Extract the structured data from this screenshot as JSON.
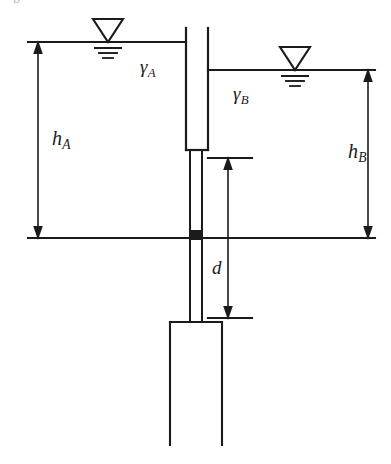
{
  "figure": {
    "type": "engineering-diagram",
    "background_color": "#ffffff",
    "line_color": "#1b1b1b",
    "width": 391,
    "height": 464
  },
  "labels": {
    "gamma_a": {
      "symbol": "γ",
      "subscript": "A"
    },
    "gamma_b": {
      "symbol": "γ",
      "subscript": "B"
    },
    "h_a": {
      "symbol": "h",
      "subscript": "A"
    },
    "h_b": {
      "symbol": "h",
      "subscript": "B"
    },
    "d": {
      "symbol": "d",
      "subscript": ""
    },
    "cut_off_top": "B"
  },
  "elements": {
    "water_surface_left": {
      "name": "water-surface-line-left",
      "y": 42,
      "x1": 28,
      "x2": 186
    },
    "water_surface_right": {
      "name": "water-surface-line-right",
      "y": 70,
      "x1": 208,
      "x2": 375
    },
    "ground_line": {
      "name": "ground-surface-line",
      "y": 238,
      "x1": 28,
      "x2": 375
    },
    "water_table_symbol_left": {
      "name": "water-table-symbol-left",
      "x": 108,
      "y": 42
    },
    "water_table_symbol_right": {
      "name": "water-table-symbol-right",
      "x": 295,
      "y": 70
    },
    "wall_upper_box": {
      "name": "wall-upper-section",
      "x1": 186,
      "x2": 208,
      "y1": 28,
      "y2": 150
    },
    "wall_shaft": {
      "name": "wall-shaft",
      "x1": 190,
      "x2": 202,
      "y1": 150,
      "y2": 322
    },
    "wall_lower_box": {
      "name": "wall-lower-section",
      "x1": 170,
      "x2": 222,
      "y1": 322,
      "y2": 445
    },
    "hinge_marker": {
      "name": "hinge-marker",
      "x": 195,
      "y": 238,
      "size": 8,
      "fill": "#1b1b1b"
    },
    "dimension_h_a": {
      "name": "dimension-arrow-h-a",
      "x": 38,
      "y1": 42,
      "y2": 238
    },
    "dimension_h_b": {
      "name": "dimension-arrow-h-b",
      "x": 368,
      "y1": 70,
      "y2": 238
    },
    "dimension_d": {
      "name": "dimension-arrow-d",
      "x": 228,
      "y1": 158,
      "y2": 318
    },
    "dimension_d_tick_top": {
      "name": "dimension-tick-top",
      "y": 158,
      "x1": 208,
      "x2": 252
    },
    "dimension_d_tick_bottom": {
      "name": "dimension-tick-bottom",
      "y": 318,
      "x1": 208,
      "x2": 252
    }
  }
}
